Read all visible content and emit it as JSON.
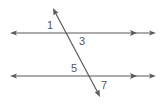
{
  "diagram": {
    "colors": {
      "stroke": "#5a5a5a",
      "label": "#555555",
      "background": "#ffffff"
    },
    "lines": [
      {
        "id": "top-parallel",
        "type": "line",
        "x1": 10,
        "y1": 33,
        "x2": 156,
        "y2": 33,
        "parallel_marker_x": 134
      },
      {
        "id": "bottom-parallel",
        "type": "line",
        "x1": 10,
        "y1": 76,
        "x2": 156,
        "y2": 76,
        "parallel_marker_x": 134
      },
      {
        "id": "transversal",
        "type": "line",
        "x1": 53,
        "y1": 8,
        "x2": 100,
        "y2": 97
      }
    ],
    "angle_labels": [
      {
        "id": "angle-1",
        "text": "1",
        "x": 47,
        "y": 29
      },
      {
        "id": "angle-3",
        "text": "3",
        "x": 79,
        "y": 45
      },
      {
        "id": "angle-5",
        "text": "5",
        "x": 71,
        "y": 72
      },
      {
        "id": "angle-7",
        "text": "7",
        "x": 101,
        "y": 89
      }
    ]
  }
}
